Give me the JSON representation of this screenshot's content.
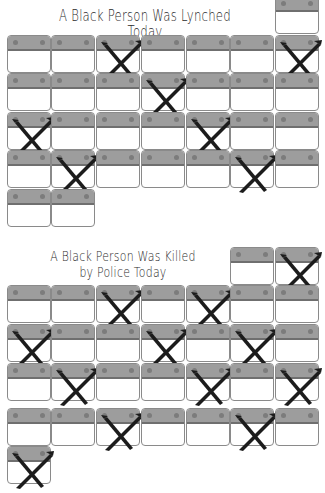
{
  "titles": {
    "lynched": "A Black Person Was Lynched Today",
    "police_line1": "A Black Person Was Killed",
    "police_line2": "by Police Today"
  },
  "colors": {
    "band": "#9d9d9d",
    "band_edge": "#6f6f6f",
    "cell_border": "#8a8a8a",
    "mark": "#1c1c1c"
  },
  "legend": {
    "mark_icon": "x-mark-icon",
    "cell_icon": "calendar-day-icon"
  },
  "chart_data": [
    {
      "type": "table",
      "title": "A Black Person Was Lynched Today",
      "columns": 7,
      "rows": [
        {
          "cells": [
            7
          ],
          "marked": []
        },
        {
          "cells": [
            1,
            2,
            3,
            4,
            5,
            6,
            7
          ],
          "marked": [
            3,
            7
          ]
        },
        {
          "cells": [
            1,
            2,
            3,
            4,
            5,
            6,
            7
          ],
          "marked": [
            4
          ]
        },
        {
          "cells": [
            1,
            2,
            3,
            4,
            5,
            6,
            7
          ],
          "marked": [
            1,
            5
          ]
        },
        {
          "cells": [
            1,
            2,
            3,
            4,
            5,
            6,
            7
          ],
          "marked": [
            2,
            6
          ]
        },
        {
          "cells": [
            1,
            2
          ],
          "marked": []
        }
      ],
      "total_days": 31,
      "marked_days": 7
    },
    {
      "type": "table",
      "title": "A Black Person Was Killed by Police Today",
      "columns": 7,
      "rows": [
        {
          "cells": [
            6,
            7
          ],
          "marked": [
            7
          ]
        },
        {
          "cells": [
            1,
            2,
            3,
            4,
            5,
            6,
            7
          ],
          "marked": [
            3,
            5
          ]
        },
        {
          "cells": [
            1,
            2,
            3,
            4,
            5,
            6,
            7
          ],
          "marked": [
            1,
            4,
            6
          ]
        },
        {
          "cells": [
            1,
            2,
            3,
            4,
            5,
            6,
            7
          ],
          "marked": [
            2,
            5,
            7
          ]
        },
        {
          "cells": [
            1,
            2,
            3,
            4,
            5,
            6,
            7
          ],
          "marked": [
            3,
            6
          ]
        },
        {
          "cells": [
            1
          ],
          "marked": [
            1
          ]
        }
      ],
      "total_days": 31,
      "marked_days": 12
    }
  ]
}
